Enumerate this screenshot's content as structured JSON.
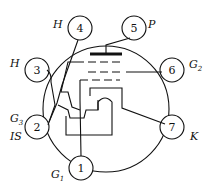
{
  "pins": [
    {
      "num": "1",
      "label": "G",
      "sub": "1"
    },
    {
      "num": "2",
      "label": "G",
      "sub": "3",
      "label2": "IS"
    },
    {
      "num": "3",
      "label": "H"
    },
    {
      "num": "4",
      "label": "H"
    },
    {
      "num": "5",
      "label": "P"
    },
    {
      "num": "6",
      "label": "G",
      "sub": "2"
    },
    {
      "num": "7",
      "label": "K"
    }
  ]
}
